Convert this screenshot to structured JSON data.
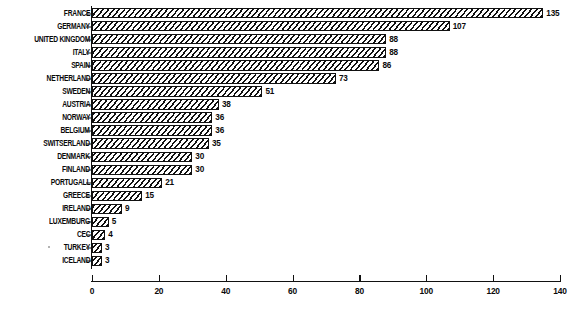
{
  "chart_data": {
    "type": "bar",
    "orientation": "horizontal",
    "title": "",
    "subtitle": "",
    "xlabel": "",
    "ylabel": "",
    "xlim": [
      0,
      140
    ],
    "xticks": [
      0,
      20,
      40,
      60,
      80,
      100,
      120,
      140
    ],
    "grid": false,
    "legend": false,
    "value_labels": true,
    "categories": [
      "FRANCE",
      "GERMANY",
      "UNITED KINGDOM",
      "ITALY",
      "SPAIN",
      "NETHERLAND",
      "SWEDEN",
      "AUSTRIA",
      "NORWAY",
      "BELGIUM",
      "SWITSERLAND",
      "DENMARK",
      "FINLAND",
      "PORTUGALL",
      "GREECE",
      "IRELAND",
      "LUXEMBURG",
      "CEC",
      "TURKEY",
      "ICELAND"
    ],
    "values": [
      135,
      107,
      88,
      88,
      86,
      73,
      51,
      38,
      36,
      36,
      35,
      30,
      30,
      21,
      15,
      9,
      5,
      4,
      3,
      3
    ],
    "bars": [
      {
        "category": "FRANCE",
        "value": 135,
        "label": "135"
      },
      {
        "category": "GERMANY",
        "value": 107,
        "label": "107"
      },
      {
        "category": "UNITED KINGDOM",
        "value": 88,
        "label": "88"
      },
      {
        "category": "ITALY",
        "value": 88,
        "label": "88"
      },
      {
        "category": "SPAIN",
        "value": 86,
        "label": "86"
      },
      {
        "category": "NETHERLAND",
        "value": 73,
        "label": "73"
      },
      {
        "category": "SWEDEN",
        "value": 51,
        "label": "51"
      },
      {
        "category": "AUSTRIA",
        "value": 38,
        "label": "38"
      },
      {
        "category": "NORWAY",
        "value": 36,
        "label": "36"
      },
      {
        "category": "BELGIUM",
        "value": 36,
        "label": "36"
      },
      {
        "category": "SWITSERLAND",
        "value": 35,
        "label": "35"
      },
      {
        "category": "DENMARK",
        "value": 30,
        "label": "30"
      },
      {
        "category": "FINLAND",
        "value": 30,
        "label": "30"
      },
      {
        "category": "PORTUGALL",
        "value": 21,
        "label": "21"
      },
      {
        "category": "GREECE",
        "value": 15,
        "label": "15"
      },
      {
        "category": "IRELAND",
        "value": 9,
        "label": "9"
      },
      {
        "category": "LUXEMBURG",
        "value": 5,
        "label": "5"
      },
      {
        "category": "CEC",
        "value": 4,
        "label": "4"
      },
      {
        "category": "TURKEY",
        "value": 3,
        "label": "3"
      },
      {
        "category": "ICELAND",
        "value": 3,
        "label": "3"
      }
    ],
    "xtick_labels": [
      "0",
      "20",
      "40",
      "60",
      "80",
      "100",
      "120",
      "140"
    ],
    "colors": {
      "bar_fill": "#ffffff",
      "bar_hatch": "#111111",
      "bar_outline": "#111111",
      "axis": "#111111",
      "text": "#0a0a0a",
      "background": "#ffffff"
    },
    "style": "black-and-white diagonal hatch fill, scanned document"
  }
}
